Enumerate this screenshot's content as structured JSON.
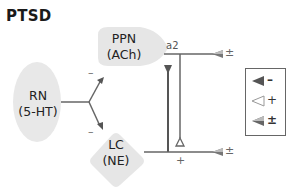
{
  "title": "PTSD",
  "nodes": {
    "rn": {
      "line1": "RN",
      "line2": "(5-HT)"
    },
    "ppn": {
      "line1": "PPN",
      "line2": "(ACh)"
    },
    "lc": {
      "line1": "LC",
      "line2": "(NE)"
    }
  },
  "edge_labels": {
    "rn_to_ppn_sign": "–",
    "rn_to_lc_sign": "–",
    "receptor": "a2",
    "ppn_output_sign": "±",
    "lc_output_sign": "±",
    "lc_to_ppn_sign": "+"
  },
  "legend": {
    "items": [
      {
        "icon": "filled-arrowhead-icon",
        "label": "–",
        "meaning": "inhibitory"
      },
      {
        "icon": "open-arrowhead-icon",
        "label": "+",
        "meaning": "excitatory"
      },
      {
        "icon": "half-filled-arrowhead-icon",
        "label": "±",
        "meaning": "mixed"
      }
    ]
  },
  "colors": {
    "node_fill": "#e6e6e6",
    "line": "#666666",
    "text": "#222222"
  }
}
